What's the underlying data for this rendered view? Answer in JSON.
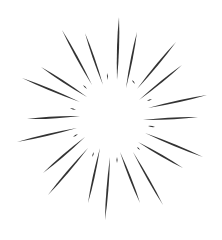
{
  "illustration": {
    "name": "sunburst",
    "description": "Hand-drawn radial starburst / speed-line burst",
    "background": "#ffffff",
    "ray_color": "#333333",
    "center": [
      112,
      118
    ],
    "rays": [
      {
        "outer": [
          119,
          17
        ],
        "inner": [
          117,
          80
        ],
        "width": 2.6
      },
      {
        "outer": [
          137,
          32
        ],
        "inner": [
          126,
          88
        ],
        "width": 2.4
      },
      {
        "outer": [
          62,
          30
        ],
        "inner": [
          92,
          85
        ],
        "width": 2.4
      },
      {
        "outer": [
          85,
          33
        ],
        "inner": [
          103,
          85
        ],
        "width": 2.2
      },
      {
        "outer": [
          176,
          42
        ],
        "inner": [
          137,
          89
        ],
        "width": 2.4
      },
      {
        "outer": [
          182,
          65
        ],
        "inner": [
          139,
          100
        ],
        "width": 2.2
      },
      {
        "outer": [
          41,
          67
        ],
        "inner": [
          87,
          97
        ],
        "width": 2.4
      },
      {
        "outer": [
          22,
          78
        ],
        "inner": [
          80,
          102
        ],
        "width": 2.4
      },
      {
        "outer": [
          207,
          95
        ],
        "inner": [
          148,
          108
        ],
        "width": 2.4
      },
      {
        "outer": [
          27,
          119
        ],
        "inner": [
          80,
          116
        ],
        "width": 2.6
      },
      {
        "outer": [
          198,
          117
        ],
        "inner": [
          143,
          120
        ],
        "width": 2.4
      },
      {
        "outer": [
          17,
          142
        ],
        "inner": [
          77,
          128
        ],
        "width": 2.4
      },
      {
        "outer": [
          203,
          157
        ],
        "inner": [
          145,
          133
        ],
        "width": 2.4
      },
      {
        "outer": [
          43,
          173
        ],
        "inner": [
          85,
          137
        ],
        "width": 2.4
      },
      {
        "outer": [
          183,
          168
        ],
        "inner": [
          138,
          142
        ],
        "width": 2.4
      },
      {
        "outer": [
          48,
          195
        ],
        "inner": [
          88,
          148
        ],
        "width": 2.4
      },
      {
        "outer": [
          163,
          205
        ],
        "inner": [
          133,
          152
        ],
        "width": 2.2
      },
      {
        "outer": [
          88,
          203
        ],
        "inner": [
          100,
          148
        ],
        "width": 2.4
      },
      {
        "outer": [
          140,
          203
        ],
        "inner": [
          120,
          152
        ],
        "width": 2.4
      },
      {
        "outer": [
          105,
          220
        ],
        "inner": [
          110,
          157
        ],
        "width": 2.4
      }
    ],
    "dashes": [
      {
        "a": [
          107,
          73
        ],
        "b": [
          108,
          80
        ],
        "width": 1.6
      },
      {
        "a": [
          132,
          80
        ],
        "b": [
          135,
          84
        ],
        "width": 1.6
      },
      {
        "a": [
          83,
          85
        ],
        "b": [
          87,
          89
        ],
        "width": 1.6
      },
      {
        "a": [
          70,
          108
        ],
        "b": [
          76,
          110
        ],
        "width": 1.6
      },
      {
        "a": [
          147,
          101
        ],
        "b": [
          152,
          99
        ],
        "width": 1.6
      },
      {
        "a": [
          148,
          126
        ],
        "b": [
          155,
          127
        ],
        "width": 1.6
      },
      {
        "a": [
          73,
          137
        ],
        "b": [
          78,
          134
        ],
        "width": 1.6
      },
      {
        "a": [
          92,
          157
        ],
        "b": [
          94,
          152
        ],
        "width": 1.6
      },
      {
        "a": [
          117,
          157
        ],
        "b": [
          117,
          163
        ],
        "width": 1.6
      },
      {
        "a": [
          137,
          147
        ],
        "b": [
          140,
          150
        ],
        "width": 1.6
      }
    ]
  }
}
